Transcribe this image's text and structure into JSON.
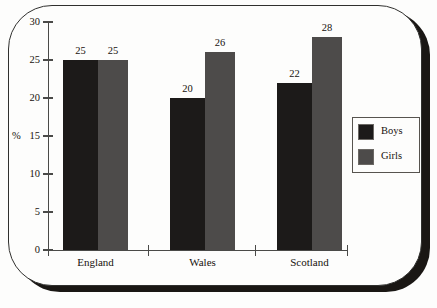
{
  "chart_data": {
    "type": "bar",
    "title": "",
    "xlabel": "",
    "ylabel": "%",
    "categories": [
      "England",
      "Wales",
      "Scotland"
    ],
    "series": [
      {
        "name": "Boys",
        "color": "#1c1a19",
        "values": [
          25,
          20,
          22
        ]
      },
      {
        "name": "Girls",
        "color": "#4d4b4a",
        "values": [
          25,
          26,
          28
        ]
      }
    ],
    "ylim": [
      0,
      30
    ],
    "yticks": [
      0,
      5,
      10,
      15,
      20,
      25,
      30
    ],
    "ytick_labels": [
      "0",
      "5",
      "10",
      "15",
      "20",
      "25",
      "30"
    ],
    "grid": false,
    "legend_position": "right",
    "data_labels": true
  },
  "legend": {
    "items": [
      {
        "label": "Boys",
        "color": "#1c1a19"
      },
      {
        "label": "Girls",
        "color": "#4d4b4a"
      }
    ]
  },
  "axis": {
    "y_unit_label": "%"
  }
}
